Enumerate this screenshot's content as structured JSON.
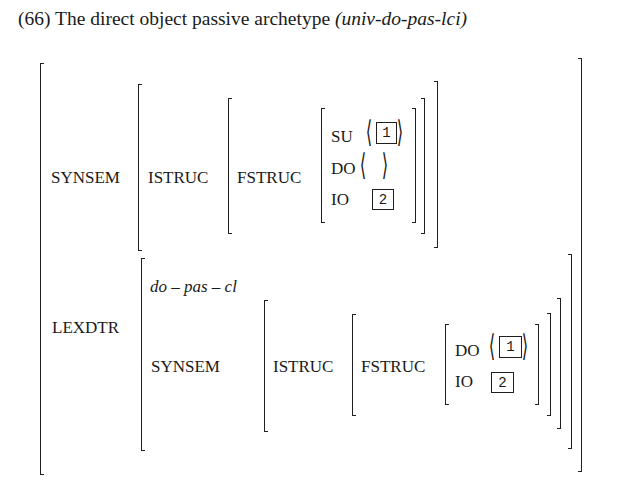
{
  "example": {
    "number": "(66)",
    "title": "The direct object passive archetype",
    "type_name": "(univ-do-pas-lci)"
  },
  "avm": {
    "synsem": {
      "label": "SYNSEM",
      "istruc_label": "ISTRUC",
      "fstruc_label": "FSTRUC",
      "features": [
        {
          "attr": "SU",
          "value": "⟨ 1 ⟩",
          "tag": "1",
          "list": true
        },
        {
          "attr": "DO",
          "value": "⟨ ⟩",
          "tag": "",
          "list": true
        },
        {
          "attr": "IO",
          "value": "2",
          "tag": "2",
          "list": false
        }
      ]
    },
    "lexdtr": {
      "label": "LEXDTR",
      "type": "do – pas – cl",
      "synsem_label": "SYNSEM",
      "istruc_label": "ISTRUC",
      "fstruc_label": "FSTRUC",
      "features": [
        {
          "attr": "DO",
          "value": "⟨ 1 ⟩",
          "tag": "1",
          "list": true
        },
        {
          "attr": "IO",
          "value": "2",
          "tag": "2",
          "list": false
        }
      ]
    }
  }
}
